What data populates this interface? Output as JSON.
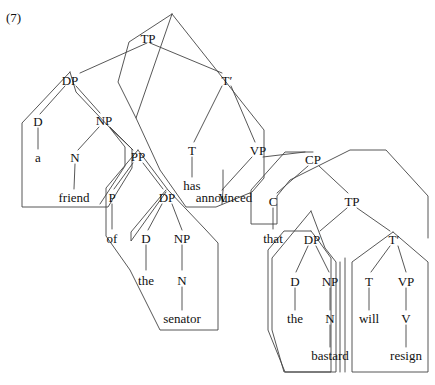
{
  "figure": {
    "example_number": "(7)",
    "sentence": "a friend of the senator has announced that the bastard will resign",
    "diagram_type": "phrase-structure-tree"
  },
  "nodes": {
    "tp_main": "TP",
    "dp_subject": "DP",
    "d_a": "D",
    "np_friend": "NP",
    "n_friend": "N",
    "pp_of": "PP",
    "p_of": "P",
    "dp_senator": "DP",
    "d_the1": "D",
    "np_senator": "NP",
    "n_senator": "N",
    "tbar_main": "T′",
    "t_has": "T",
    "vp_main": "VP",
    "v_announced": "V",
    "cp": "CP",
    "c_that": "C",
    "tp_embedded": "TP",
    "dp_bastard": "DP",
    "d_the2": "D",
    "np_bastard": "NP",
    "n_bastard": "N",
    "tbar_embedded": "T′",
    "t_will": "T",
    "vp_embedded": "VP",
    "v_resign": "V"
  },
  "leaves": {
    "a": "a",
    "friend": "friend",
    "of": "of",
    "the_senator_det": "the",
    "senator": "senator",
    "has": "has",
    "announced": "announced",
    "that": "that",
    "the_bastard_det": "the",
    "bastard": "bastard",
    "will": "will",
    "resign": "resign"
  },
  "colors": {
    "line": "#444444",
    "text": "#111111",
    "background": "#ffffff"
  },
  "constituent_outlines": [
    {
      "name": "subject-dp-outline",
      "label": "a friend of the senator"
    },
    {
      "name": "pp-of-the-senator-outline",
      "label": "of the senator"
    },
    {
      "name": "dp-the-senator-outline",
      "label": "the senator"
    },
    {
      "name": "tbar-main-outline",
      "label": "has announced that the bastard will resign"
    },
    {
      "name": "cp-outline",
      "label": "that the bastard will resign"
    },
    {
      "name": "embedded-tp-outline",
      "label": "the bastard will resign"
    },
    {
      "name": "dp-the-bastard-outline",
      "label": "the bastard"
    },
    {
      "name": "tbar-embedded-outline",
      "label": "will resign"
    }
  ]
}
